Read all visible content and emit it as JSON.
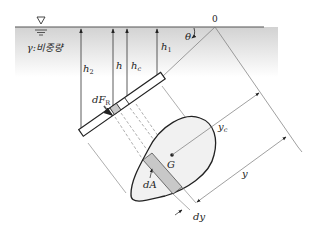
{
  "diagram": {
    "fluid_label": "γ:비중량",
    "origin_label": "0",
    "angle_label": "θ",
    "labels": {
      "h2": "h",
      "h2_sub": "2",
      "h": "h",
      "hc": "h",
      "hc_sub": "c",
      "h1": "h",
      "h1_sub": "1",
      "dFR": "dF",
      "dFR_sub": "R",
      "G": "G",
      "dA": "dA",
      "yc": "y",
      "yc_sub": "c",
      "y": "y",
      "dy": "dy"
    },
    "colors": {
      "water_top": "#d4d4d4",
      "water_bottom": "#ffffff",
      "surface_line": "#555555",
      "shape_fill": "#f1f1f1",
      "strip_fill": "#c8c8c8",
      "stroke": "#222222",
      "thin_line": "#777777"
    }
  }
}
